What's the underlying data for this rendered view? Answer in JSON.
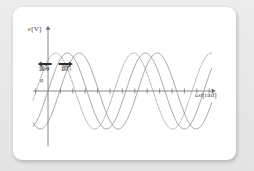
{
  "figure": {
    "background_color": "#ffffff",
    "page_color": "#e8e8e8",
    "curve_color": "#8a8a8a",
    "axis_color": "#6b6b6b",
    "arrow_color": "#2b2b2b"
  },
  "labels": {
    "y_axis": "e",
    "y_axis_unit": "[V]",
    "x_axis": "ωt",
    "x_axis_unit": "[rad]",
    "phase_symbol": "φ",
    "lead_text": "進み",
    "lag_text": "遅れ",
    "arrow_left": "←",
    "arrow_right": "→"
  },
  "chart_data": {
    "type": "line",
    "title": "",
    "xlabel": "ωt [rad]",
    "ylabel": "e [V]",
    "xlim": [
      -1.2,
      13.2
    ],
    "ylim": [
      -1.35,
      1.35
    ],
    "grid": false,
    "legend_position": "none",
    "x_tick_count": 14,
    "x_tick_spacing_rad": 1,
    "annotations": [
      {
        "text": "進み",
        "meaning": "lead",
        "arrow": "left",
        "x_rad": -0.35,
        "y": 0.62
      },
      {
        "text": "遅れ",
        "meaning": "lag",
        "arrow": "right",
        "x_rad": 0.85,
        "y": 0.62
      },
      {
        "text": "φ",
        "meaning": "phase angle",
        "x_rad": -0.45,
        "y": 0.12
      }
    ],
    "series": [
      {
        "name": "leading-wave",
        "style": "dotted",
        "amplitude": 1.0,
        "phase_rad": 0.95,
        "angular_frequency": 1.0,
        "description": "sin(ωt + φ) — phase lead, drawn dotted"
      },
      {
        "name": "reference-wave",
        "style": "solid",
        "amplitude": 1.0,
        "phase_rad": 0.0,
        "angular_frequency": 1.0,
        "description": "sin(ωt) — reference waveform"
      },
      {
        "name": "lagging-wave",
        "style": "solid",
        "amplitude": 1.0,
        "phase_rad": -0.95,
        "angular_frequency": 1.0,
        "description": "sin(ωt - φ) — phase lag"
      }
    ]
  }
}
